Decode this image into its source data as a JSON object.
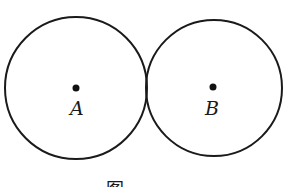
{
  "diagram": {
    "type": "geometry",
    "circles": [
      {
        "id": "A",
        "label": "A",
        "cx": 76,
        "cy": 88,
        "r": 71
      },
      {
        "id": "B",
        "label": "B",
        "cx": 214,
        "cy": 88,
        "r": 68
      }
    ],
    "caption": "图"
  }
}
